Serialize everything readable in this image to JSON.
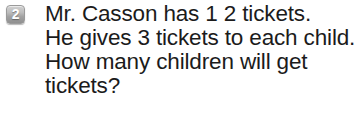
{
  "canvas": {
    "width": 359,
    "height": 114,
    "background_color": "#ffffff"
  },
  "question": {
    "number_badge": {
      "icon_name": "question-number-badge",
      "label": "2",
      "fill_color_top": "#d2d2d2",
      "fill_color_bottom": "#909090",
      "text_color": "#ffffff"
    },
    "text_color": "#1b1b1b",
    "lines": [
      "Mr. Casson has 1 2 tickets.",
      "He gives 3 tickets to each child.",
      "How many children will get",
      "tickets?"
    ],
    "full_text": "Mr. Casson has 12 tickets. He gives 3 tickets to each child. How many children will get tickets?",
    "values": {
      "total_tickets": 12,
      "tickets_per_child": 3
    }
  }
}
